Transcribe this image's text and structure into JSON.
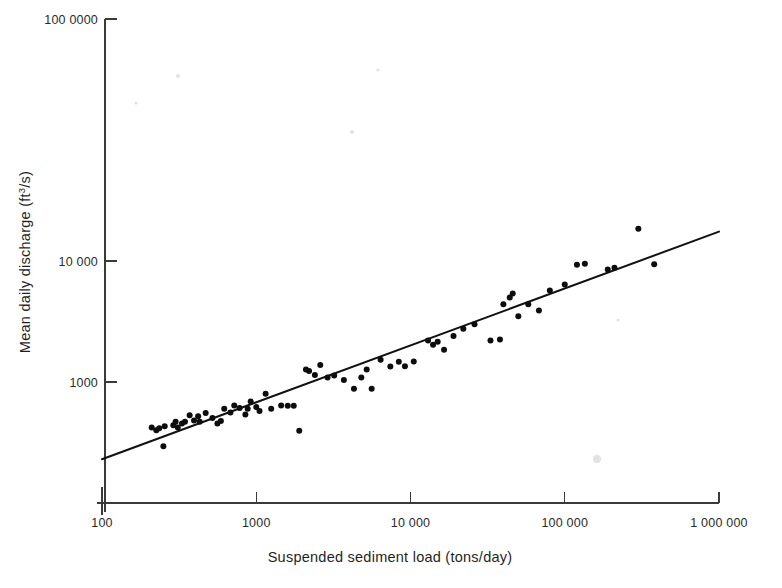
{
  "chart_data": {
    "type": "scatter",
    "title": "",
    "xlabel": "Suspended sediment load (tons/day)",
    "ylabel": "Mean daily discharge (ft3/s)",
    "ylabel_base": "Mean daily discharge (ft",
    "ylabel_sup": "3",
    "ylabel_tail": "/s)",
    "xscale": "log",
    "yscale": "log",
    "xlim": [
      100,
      1000000
    ],
    "ylim": [
      100,
      1000000
    ],
    "grid": false,
    "legend": null,
    "xticks": [
      100,
      1000,
      10000,
      100000,
      1000000
    ],
    "xtick_labels": [
      "100",
      "1000",
      "10 000",
      "100 000",
      "1 000 000"
    ],
    "yticks": [
      1000,
      10000,
      1000000
    ],
    "ytick_labels": [
      "1000",
      "10 000",
      "100 0000"
    ],
    "trendline": {
      "description": "log-log regression line",
      "x_start": 100,
      "y_start": 230,
      "x_end": 1000000,
      "y_end": 17500
    },
    "point_color": "#0d0d0d",
    "line_color": "#111111",
    "axis_color": "#3a3a3a",
    "points": [
      [
        210,
        420
      ],
      [
        225,
        400
      ],
      [
        235,
        415
      ],
      [
        250,
        295
      ],
      [
        255,
        430
      ],
      [
        290,
        440
      ],
      [
        300,
        470
      ],
      [
        310,
        420
      ],
      [
        330,
        455
      ],
      [
        345,
        470
      ],
      [
        370,
        530
      ],
      [
        395,
        480
      ],
      [
        420,
        520
      ],
      [
        430,
        470
      ],
      [
        470,
        555
      ],
      [
        520,
        505
      ],
      [
        560,
        455
      ],
      [
        590,
        475
      ],
      [
        620,
        600
      ],
      [
        680,
        560
      ],
      [
        720,
        640
      ],
      [
        780,
        610
      ],
      [
        850,
        540
      ],
      [
        880,
        600
      ],
      [
        920,
        690
      ],
      [
        1000,
        620
      ],
      [
        1050,
        575
      ],
      [
        1150,
        800
      ],
      [
        1250,
        600
      ],
      [
        1450,
        640
      ],
      [
        1600,
        635
      ],
      [
        1750,
        635
      ],
      [
        1900,
        395
      ],
      [
        2100,
        1270
      ],
      [
        2200,
        1230
      ],
      [
        2400,
        1140
      ],
      [
        2600,
        1380
      ],
      [
        2900,
        1090
      ],
      [
        3200,
        1130
      ],
      [
        3700,
        1040
      ],
      [
        4300,
        880
      ],
      [
        4800,
        1090
      ],
      [
        5200,
        1270
      ],
      [
        5600,
        880
      ],
      [
        6400,
        1530
      ],
      [
        7400,
        1340
      ],
      [
        8400,
        1470
      ],
      [
        9200,
        1350
      ],
      [
        10500,
        1480
      ],
      [
        13000,
        2200
      ],
      [
        14000,
        2030
      ],
      [
        15000,
        2150
      ],
      [
        16500,
        1850
      ],
      [
        19000,
        2400
      ],
      [
        22000,
        2750
      ],
      [
        26000,
        3000
      ],
      [
        33000,
        2200
      ],
      [
        38000,
        2250
      ],
      [
        40000,
        4400
      ],
      [
        44000,
        5000
      ],
      [
        46000,
        5400
      ],
      [
        50000,
        3500
      ],
      [
        58000,
        4400
      ],
      [
        68000,
        3900
      ],
      [
        80000,
        5700
      ],
      [
        100000,
        6400
      ],
      [
        120000,
        9300
      ],
      [
        135000,
        9500
      ],
      [
        190000,
        8500
      ],
      [
        210000,
        8800
      ],
      [
        300000,
        18500
      ],
      [
        380000,
        9400
      ]
    ]
  }
}
